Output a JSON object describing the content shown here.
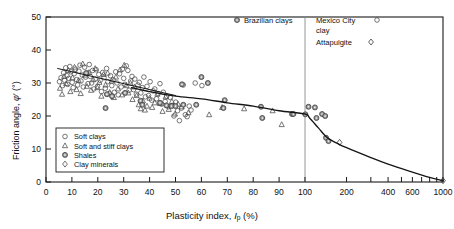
{
  "chart_data": {
    "type": "scatter",
    "title": "",
    "xlabel": "Plasticity index, Ip (%)",
    "ylabel": "Friction angle, φ' (°)",
    "xlabel_parts": {
      "prefix": "Plasticity index, ",
      "symbol": "I",
      "sub": "p",
      "suffix": " (%)"
    },
    "ylabel_parts": {
      "prefix": "Friction angle, ",
      "symbol": "φ",
      "prime": "'",
      "suffix": " (°)"
    },
    "x_scale": "linear 0-100 then log 100-1000",
    "xlim": [
      0,
      1000
    ],
    "ylim": [
      0,
      50
    ],
    "grid": false,
    "x_ticks_linear": [
      0,
      10,
      20,
      30,
      40,
      50,
      60,
      70,
      80,
      90,
      100
    ],
    "x_ticks_log_labeled": [
      200,
      400,
      600,
      1000
    ],
    "x_ticks_log_minor": [
      200,
      300,
      400,
      500,
      600,
      700,
      800,
      900,
      1000
    ],
    "y_ticks": [
      0,
      10,
      20,
      30,
      40,
      50
    ],
    "divider_x": 100,
    "divider_label": "IP = 100 separator",
    "legend_position": "lower-left inside axes",
    "series": [
      {
        "name": "Soft clays",
        "marker": "circle",
        "fill": "none",
        "stroke": "#4a4a4a",
        "points": [
          [
            5.2,
            30.4
          ],
          [
            5.8,
            31.6
          ],
          [
            6.4,
            29.2
          ],
          [
            6.8,
            33.1
          ],
          [
            7.2,
            30.8
          ],
          [
            7.6,
            34.6
          ],
          [
            8.1,
            32.2
          ],
          [
            8.4,
            29.6
          ],
          [
            8.8,
            31.4
          ],
          [
            9.2,
            35.0
          ],
          [
            9.6,
            33.4
          ],
          [
            10.1,
            30.2
          ],
          [
            10.5,
            28.6
          ],
          [
            10.9,
            32.8
          ],
          [
            11.4,
            34.2
          ],
          [
            11.8,
            31.0
          ],
          [
            12.2,
            29.4
          ],
          [
            12.7,
            33.6
          ],
          [
            13.1,
            35.4
          ],
          [
            13.5,
            30.6
          ],
          [
            14.0,
            32.4
          ],
          [
            14.4,
            28.8
          ],
          [
            14.9,
            34.8
          ],
          [
            15.3,
            31.8
          ],
          [
            15.8,
            33.0
          ],
          [
            16.2,
            29.8
          ],
          [
            16.7,
            35.6
          ],
          [
            17.1,
            32.0
          ],
          [
            17.6,
            30.0
          ],
          [
            18.0,
            33.8
          ],
          [
            18.5,
            28.2
          ],
          [
            19.0,
            31.2
          ],
          [
            19.4,
            34.0
          ],
          [
            19.9,
            29.0
          ],
          [
            20.4,
            32.6
          ],
          [
            20.9,
            30.8
          ],
          [
            21.4,
            27.4
          ],
          [
            21.9,
            33.2
          ],
          [
            22.4,
            31.6
          ],
          [
            22.9,
            28.4
          ],
          [
            23.4,
            34.4
          ],
          [
            23.9,
            30.4
          ],
          [
            24.4,
            26.8
          ],
          [
            24.9,
            32.2
          ],
          [
            25.4,
            29.2
          ],
          [
            25.9,
            31.0
          ],
          [
            26.4,
            27.2
          ],
          [
            26.9,
            33.4
          ],
          [
            27.4,
            30.0
          ],
          [
            27.9,
            26.4
          ],
          [
            28.4,
            32.8
          ],
          [
            29.0,
            28.8
          ],
          [
            29.5,
            34.2
          ],
          [
            30.0,
            31.4
          ],
          [
            30.5,
            29.6
          ],
          [
            31.0,
            35.2
          ],
          [
            31.6,
            33.8
          ],
          [
            32.1,
            27.8
          ],
          [
            32.7,
            30.6
          ],
          [
            33.2,
            32.0
          ],
          [
            33.8,
            28.0
          ],
          [
            34.3,
            31.2
          ],
          [
            34.9,
            26.6
          ],
          [
            35.5,
            29.4
          ],
          [
            36.0,
            30.2
          ],
          [
            36.6,
            27.0
          ],
          [
            37.2,
            28.6
          ],
          [
            37.8,
            31.8
          ],
          [
            38.4,
            25.8
          ],
          [
            39.0,
            29.0
          ],
          [
            39.6,
            26.2
          ],
          [
            40.2,
            30.4
          ],
          [
            40.8,
            24.8
          ],
          [
            41.4,
            27.6
          ],
          [
            42.0,
            28.2
          ],
          [
            42.7,
            25.2
          ],
          [
            43.3,
            26.8
          ],
          [
            44.0,
            29.8
          ],
          [
            44.6,
            23.6
          ],
          [
            45.3,
            27.2
          ],
          [
            46.0,
            24.4
          ],
          [
            46.6,
            26.0
          ],
          [
            47.3,
            22.8
          ],
          [
            48.0,
            25.6
          ],
          [
            48.7,
            23.2
          ],
          [
            49.4,
            20.0
          ],
          [
            50.1,
            24.2
          ],
          [
            50.8,
            21.6
          ],
          [
            51.5,
            18.6
          ],
          [
            52.3,
            22.4
          ],
          [
            53.0,
            29.4
          ],
          [
            53.8,
            20.4
          ],
          [
            54.5,
            19.8
          ],
          [
            55.3,
            23.0
          ],
          [
            56.0,
            21.8
          ],
          [
            57.6,
            30.0
          ],
          [
            60.2,
            29.2
          ]
        ]
      },
      {
        "name": "Soft and stiff clays",
        "marker": "triangle",
        "fill": "none",
        "stroke": "#4a4a4a",
        "points": [
          [
            5.4,
            28.4
          ],
          [
            6.2,
            26.6
          ],
          [
            7.0,
            32.0
          ],
          [
            7.8,
            29.8
          ],
          [
            8.6,
            33.8
          ],
          [
            9.4,
            27.4
          ],
          [
            10.2,
            31.6
          ],
          [
            11.0,
            34.8
          ],
          [
            11.8,
            28.0
          ],
          [
            12.6,
            30.8
          ],
          [
            13.4,
            26.8
          ],
          [
            14.2,
            35.8
          ],
          [
            15.0,
            32.4
          ],
          [
            15.8,
            29.0
          ],
          [
            16.6,
            33.2
          ],
          [
            17.4,
            27.8
          ],
          [
            18.2,
            31.0
          ],
          [
            19.0,
            34.4
          ],
          [
            19.8,
            28.6
          ],
          [
            20.6,
            30.2
          ],
          [
            21.4,
            26.0
          ],
          [
            22.2,
            32.6
          ],
          [
            23.0,
            29.4
          ],
          [
            23.8,
            33.0
          ],
          [
            24.6,
            27.2
          ],
          [
            25.4,
            30.6
          ],
          [
            26.2,
            25.6
          ],
          [
            27.0,
            31.8
          ],
          [
            27.8,
            28.2
          ],
          [
            28.6,
            34.0
          ],
          [
            29.4,
            26.4
          ],
          [
            30.2,
            35.4
          ],
          [
            31.0,
            29.2
          ],
          [
            31.8,
            27.0
          ],
          [
            32.6,
            30.0
          ],
          [
            33.4,
            25.0
          ],
          [
            34.2,
            28.8
          ],
          [
            35.0,
            26.2
          ],
          [
            35.8,
            23.4
          ],
          [
            36.6,
            22.2
          ],
          [
            37.4,
            24.6
          ],
          [
            38.2,
            21.8
          ],
          [
            39.0,
            23.0
          ],
          [
            40.0,
            25.4
          ],
          [
            41.0,
            22.6
          ],
          [
            42.0,
            24.0
          ],
          [
            43.0,
            26.6
          ],
          [
            44.0,
            23.8
          ],
          [
            45.0,
            21.4
          ],
          [
            46.2,
            25.8
          ],
          [
            47.4,
            22.0
          ],
          [
            48.6,
            24.4
          ],
          [
            49.8,
            20.6
          ],
          [
            51.0,
            23.6
          ],
          [
            52.4,
            22.8
          ],
          [
            55.0,
            21.0
          ],
          [
            63.0,
            20.4
          ],
          [
            68.0,
            22.6
          ],
          [
            76.5,
            22.2
          ],
          [
            87.5,
            21.6
          ],
          [
            91.0,
            17.4
          ]
        ]
      },
      {
        "name": "Shales",
        "marker": "square-dot",
        "fill": "#9a9a9a",
        "stroke": "#3a3a3a",
        "points": [
          [
            52.5,
            29.6
          ],
          [
            60.0,
            31.8
          ],
          [
            62.5,
            30.0
          ],
          [
            53.0,
            23.4
          ],
          [
            69.0,
            24.8
          ],
          [
            68.5,
            22.4
          ],
          [
            83.0,
            22.8
          ],
          [
            83.5,
            19.4
          ],
          [
            95.0,
            20.6
          ],
          [
            106.0,
            22.8
          ],
          [
            118.0,
            22.6
          ],
          [
            121.0,
            19.4
          ],
          [
            133.0,
            20.6
          ],
          [
            140.0,
            20.0
          ],
          [
            142.0,
            13.4
          ],
          [
            148.0,
            12.4
          ]
        ]
      },
      {
        "name": "Clay minerals",
        "marker": "diamond",
        "fill": "none",
        "stroke": "#3a3a3a",
        "points": [
          [
            178.0,
            12.0
          ],
          [
            1000.0,
            0.4
          ]
        ]
      },
      {
        "name": "Brazilian clays",
        "marker": "square-dot",
        "fill": "#9a9a9a",
        "stroke": "#3a3a3a",
        "points": [
          [
            15.5,
            33.0
          ],
          [
            23.5,
            26.6
          ],
          [
            23.0,
            22.4
          ],
          [
            25.5,
            26.0
          ],
          [
            30.5,
            27.0
          ],
          [
            36.5,
            24.6
          ],
          [
            37.2,
            23.4
          ],
          [
            44.0,
            24.0
          ],
          [
            46.5,
            23.2
          ],
          [
            48.5,
            23.0
          ],
          [
            50.0,
            23.0
          ],
          [
            58.0,
            23.4
          ],
          [
            95.5,
            20.6
          ],
          [
            100.5,
            20.5
          ]
        ]
      },
      {
        "name": "Mexico City clay",
        "marker": "circle",
        "fill": "none",
        "stroke": "#4a4a4a",
        "points": []
      },
      {
        "name": "Attapulgite",
        "marker": "diamond",
        "fill": "none",
        "stroke": "#3a3a3a",
        "points": []
      }
    ],
    "trend_lines": [
      {
        "name": "regression-line-left",
        "points": [
          [
            4.5,
            34.4
          ],
          [
            10.0,
            33.2
          ],
          [
            20.0,
            31.0
          ],
          [
            30.0,
            29.2
          ],
          [
            40.0,
            27.6
          ],
          [
            50.0,
            26.2
          ]
        ]
      },
      {
        "name": "main-envelope-curve",
        "points": [
          [
            33.0,
            28.6
          ],
          [
            40.0,
            27.4
          ],
          [
            50.0,
            26.0
          ],
          [
            60.0,
            25.2
          ],
          [
            70.0,
            24.0
          ],
          [
            80.0,
            23.0
          ],
          [
            90.0,
            21.6
          ],
          [
            100.0,
            20.6
          ],
          [
            108.0,
            19.4
          ],
          [
            125.0,
            16.4
          ],
          [
            145.0,
            13.4
          ],
          [
            170.0,
            11.8
          ],
          [
            200.0,
            10.4
          ],
          [
            300.0,
            7.4
          ],
          [
            400.0,
            5.4
          ],
          [
            600.0,
            3.0
          ],
          [
            800.0,
            1.4
          ],
          [
            1000.0,
            0.4
          ]
        ]
      }
    ],
    "annotations": [
      {
        "name": "brazilian-clays-key",
        "label": "Brazilian clays",
        "marker": "square-dot"
      },
      {
        "name": "mexico-city-clay-key",
        "label_line1": "Mexico City",
        "label_line2": "clay",
        "marker": "circle"
      },
      {
        "name": "attapulgite-key",
        "label": "Attapulgite",
        "marker": "diamond"
      }
    ]
  },
  "axis": {
    "y_label_text": "Friction angle, φ' (°)",
    "x_label_text": "Plasticity index, Ip (%)",
    "y_tick_labels": [
      "0",
      "10",
      "20",
      "30",
      "40",
      "50"
    ],
    "x_tick_labels": [
      "0",
      "10",
      "20",
      "30",
      "40",
      "50",
      "60",
      "70",
      "80",
      "90",
      "100",
      "200",
      "400",
      "600",
      "1000"
    ]
  },
  "legend": {
    "items": [
      {
        "label": "Soft clays",
        "marker": "circle"
      },
      {
        "label": "Soft and stiff clays",
        "marker": "triangle"
      },
      {
        "label": "Shales",
        "marker": "square-dot"
      },
      {
        "label": "Clay minerals",
        "marker": "diamond"
      }
    ]
  },
  "colors": {
    "frame": "#1a1a1a",
    "divider": "#8a8a8a",
    "marker_open": "#4a4a4a",
    "marker_fill": "#9a9a9a",
    "curve": "#151515",
    "background": "#ffffff"
  }
}
